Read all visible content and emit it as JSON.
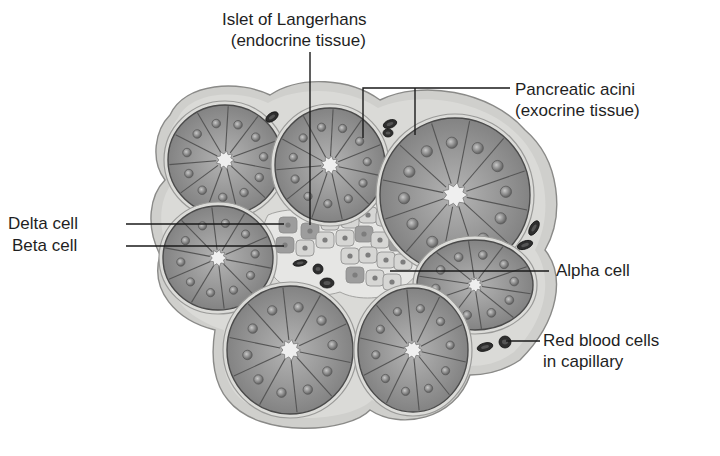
{
  "figure": {
    "style": "grayscale illustration",
    "colors": {
      "background": "#ffffff",
      "connective_tissue": "#c9c9c6",
      "connective_tissue_light": "#dcdcd9",
      "acinar_cell": "#8e8e8e",
      "acinar_cell_light": "#a3a3a3",
      "acinar_outline": "#4a4a4a",
      "nucleus": "#6f6f6f",
      "lumen": "#efefef",
      "islet_cell": "#d6d6d4",
      "islet_cell_dark": "#9d9d9d",
      "red_blood_cell": "#2e2e2e",
      "label_text": "#1f1f1f",
      "leader_line": "#1a1a1a"
    }
  },
  "labels": {
    "islet": {
      "line1": "Islet of Langerhans",
      "line2": "(endocrine tissue)"
    },
    "acini": {
      "line1": "Pancreatic acini",
      "line2": "(exocrine tissue)"
    },
    "delta": {
      "line1": "Delta cell"
    },
    "beta": {
      "line1": "Beta cell"
    },
    "alpha": {
      "line1": "Alpha cell"
    },
    "rbc": {
      "line1": "Red blood cells",
      "line2": "in capillary"
    }
  },
  "structures": {
    "acini": [
      {
        "id": "acinus-top-left",
        "cx": 225,
        "cy": 160,
        "rx": 57,
        "ry": 55,
        "cells": 11
      },
      {
        "id": "acinus-top-middle",
        "cx": 330,
        "cy": 165,
        "rx": 55,
        "ry": 57,
        "cells": 11
      },
      {
        "id": "acinus-top-right",
        "cx": 455,
        "cy": 195,
        "rx": 75,
        "ry": 77,
        "cells": 12
      },
      {
        "id": "acinus-left-middle",
        "cx": 218,
        "cy": 258,
        "rx": 55,
        "ry": 52,
        "cells": 10
      },
      {
        "id": "acinus-right-middle",
        "cx": 475,
        "cy": 285,
        "rx": 58,
        "ry": 45,
        "cells": 10
      },
      {
        "id": "acinus-bottom-left",
        "cx": 290,
        "cy": 350,
        "rx": 63,
        "ry": 64,
        "cells": 10
      },
      {
        "id": "acinus-bottom-middle",
        "cx": 413,
        "cy": 350,
        "rx": 55,
        "ry": 62,
        "cells": 10
      }
    ],
    "red_blood_cells": [
      {
        "cx": 272,
        "cy": 117,
        "rx": 7,
        "ry": 4,
        "rot": -35
      },
      {
        "cx": 390,
        "cy": 124,
        "rx": 7,
        "ry": 4,
        "rot": -20
      },
      {
        "cx": 388,
        "cy": 133,
        "rx": 5,
        "ry": 4,
        "rot": 0
      },
      {
        "cx": 534,
        "cy": 228,
        "rx": 8,
        "ry": 4,
        "rot": -60
      },
      {
        "cx": 525,
        "cy": 245,
        "rx": 8,
        "ry": 4,
        "rot": -20
      },
      {
        "cx": 300,
        "cy": 263,
        "rx": 7,
        "ry": 3,
        "rot": -10
      },
      {
        "cx": 318,
        "cy": 269,
        "rx": 5,
        "ry": 5,
        "rot": 0
      },
      {
        "cx": 327,
        "cy": 283,
        "rx": 7,
        "ry": 5,
        "rot": 0
      },
      {
        "cx": 485,
        "cy": 347,
        "rx": 8,
        "ry": 4,
        "rot": -15
      },
      {
        "cx": 505,
        "cy": 342,
        "rx": 6,
        "ry": 6,
        "rot": 0
      }
    ]
  }
}
